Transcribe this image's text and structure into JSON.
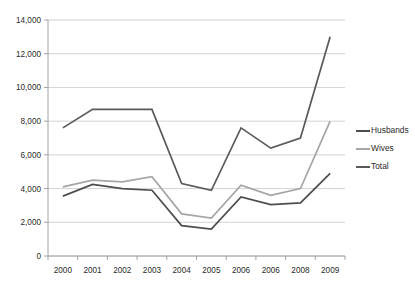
{
  "chart_data": {
    "type": "line",
    "title": "",
    "xlabel": "",
    "ylabel": "",
    "categories": [
      "2000",
      "2001",
      "2002",
      "2003",
      "2004",
      "2005",
      "2006",
      "2006",
      "2008",
      "2009"
    ],
    "ylim": [
      0,
      14000
    ],
    "ytick_values": [
      0,
      2000,
      4000,
      6000,
      8000,
      10000,
      12000,
      14000
    ],
    "ytick_labels": [
      "0",
      "2,000",
      "4,000",
      "6,000",
      "8,000",
      "10,000",
      "12,000",
      "14,000"
    ],
    "grid": true,
    "legend_position": "right",
    "series": [
      {
        "name": "Husbands",
        "color": "#4d4d4d",
        "values": [
          3550,
          4250,
          4000,
          3900,
          1800,
          1600,
          3500,
          3050,
          3150,
          4900
        ]
      },
      {
        "name": "Wives",
        "color": "#a6a6a6",
        "values": [
          4100,
          4500,
          4400,
          4700,
          2500,
          2250,
          4200,
          3600,
          4000,
          8000
        ]
      },
      {
        "name": "Total",
        "color": "#5a5a5a",
        "values": [
          7600,
          8700,
          8700,
          8700,
          4300,
          3900,
          7600,
          6400,
          7000,
          13000
        ]
      }
    ]
  },
  "legend": {
    "items": [
      {
        "label": "Husbands",
        "color": "#4d4d4d"
      },
      {
        "label": "Wives",
        "color": "#a6a6a6"
      },
      {
        "label": "Total",
        "color": "#5a5a5a"
      }
    ]
  },
  "axes": {
    "grid_color": "#c8c8c8",
    "axis_color": "#9a9a9a"
  }
}
